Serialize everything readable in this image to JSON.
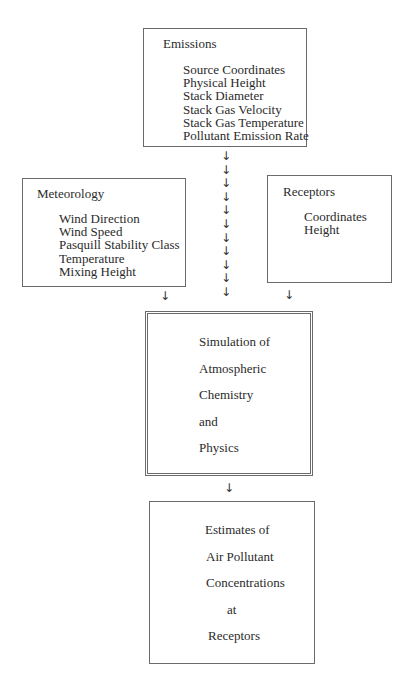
{
  "diagram": {
    "emissions": {
      "title": "Emissions",
      "items": [
        "Source Coordinates",
        "Physical Height",
        "Stack Diameter",
        "Stack Gas Velocity",
        "Stack Gas Temperature",
        "Pollutant Emission Rate"
      ]
    },
    "meteorology": {
      "title": "Meteorology",
      "items": [
        "Wind Direction",
        "Wind Speed",
        "Pasquill Stability Class",
        "Temperature",
        "Mixing Height"
      ]
    },
    "receptors": {
      "title": "Receptors",
      "items": [
        "Coordinates",
        "Height"
      ]
    },
    "simulation": {
      "lines": [
        "Simulation of",
        "Atmospheric",
        "Chemistry",
        "and",
        "Physics"
      ]
    },
    "estimates": {
      "lines": [
        "Estimates of",
        "Air Pollutant",
        "Concentrations",
        "at",
        "Receptors"
      ]
    },
    "arrow_glyph": "↓",
    "central_arrow_count": 11
  }
}
